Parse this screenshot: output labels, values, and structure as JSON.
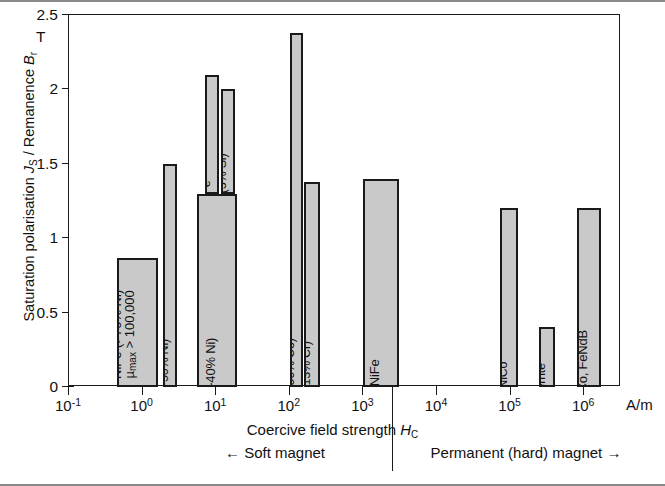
{
  "figure": {
    "y_axis_title_prefix": "Saturation polarisation ",
    "y_axis_sym1": "J",
    "y_axis_sub1": "S",
    "y_axis_mid": " / Remanence ",
    "y_axis_sym2": "B",
    "y_axis_sub2": "r",
    "y_unit": "T",
    "x_axis_title_prefix": "Coercive field strength ",
    "x_axis_sym": "H",
    "x_axis_sub": "C",
    "x_unit": "A/m",
    "zone_soft": "← Soft magnet",
    "zone_hard": "Permanent (hard) magnet →"
  },
  "chart_data": {
    "type": "bar",
    "title": "",
    "xlabel": "Coercive field strength H_C",
    "ylabel": "Saturation polarisation J_S / Remanence B_r",
    "y_unit": "T",
    "x_unit": "A/m",
    "xscale": "log",
    "xlim": [
      0.1,
      3162277.7
    ],
    "ylim": [
      0,
      2.5
    ],
    "grid": false,
    "legend": null,
    "y_ticks": [
      "0",
      "0.5",
      "1",
      "1.5",
      "2",
      "2.5"
    ],
    "y_tick_values": [
      0,
      0.5,
      1,
      1.5,
      2,
      2.5
    ],
    "x_ticks": [
      "10⁻¹",
      "10⁰",
      "10¹",
      "10²",
      "10³",
      "10⁴",
      "10⁵",
      "10⁶"
    ],
    "x_tick_values": [
      0.1,
      1,
      10,
      100,
      1000,
      10000,
      100000,
      1000000
    ],
    "bars": [
      {
        "label": "NiFe (>70% Ni)",
        "label_line2": "μ_max > 100,000",
        "label_line2_display": "µmax > 100,000",
        "value": 0.87,
        "x_start": 0.45,
        "x_end": 1.6,
        "base": 0
      },
      {
        "label": "NiFe (~50% Ni)",
        "value": 1.5,
        "x_start": 1.9,
        "x_end": 2.9,
        "base": 0
      },
      {
        "label": "NiFe (~40% Ni)",
        "value": 1.3,
        "x_start": 5.5,
        "x_end": 19.0,
        "base": 0
      },
      {
        "label": "Fe",
        "value": 2.1,
        "x_start": 7.0,
        "x_end": 11.0,
        "base": 1.3
      },
      {
        "label": "FeSi (3% Si)",
        "value": 2.0,
        "x_start": 11.5,
        "x_end": 18.0,
        "base": 1.3
      },
      {
        "label": "FeCo (50% Co)",
        "value": 2.38,
        "x_start": 100.0,
        "x_end": 150.0,
        "base": 0
      },
      {
        "label": "FeCr (13% Cr)",
        "value": 1.38,
        "x_start": 155.0,
        "x_end": 260.0,
        "base": 0
      },
      {
        "label": "CoNiFe",
        "value": 1.4,
        "x_start": 1000.0,
        "x_end": 3000.0,
        "base": 0
      },
      {
        "label": "AlNiCo",
        "value": 1.2,
        "x_start": 72000.0,
        "x_end": 125000.0,
        "base": 0
      },
      {
        "label": "Ferrite",
        "value": 0.4,
        "x_start": 240000.0,
        "x_end": 400000.0,
        "base": 0
      },
      {
        "label": "SE/SmCo, FeNdB",
        "value": 1.2,
        "x_start": 800000.0,
        "x_end": 1700000.0,
        "base": 0
      }
    ],
    "annotations": [
      {
        "text": "← Soft magnet",
        "x_region": "left-of-1000"
      },
      {
        "text": "Permanent (hard) magnet →",
        "x_region": "right-of-1000"
      }
    ],
    "colors": {
      "bar_fill": "#c9c9c9",
      "bar_edge": "#1a1a1a",
      "axis": "#1a1a1a",
      "background": "#ffffff"
    }
  }
}
